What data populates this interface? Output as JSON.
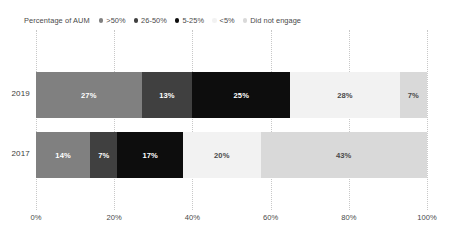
{
  "legend": {
    "title": "Percentage of AUM",
    "items": [
      {
        "label": ">50%",
        "color": "#808080"
      },
      {
        "label": "26-50%",
        "color": "#404040"
      },
      {
        "label": "5-25%",
        "color": "#0d0d0d"
      },
      {
        "label": "<5%",
        "color": "#f2f2f2"
      },
      {
        "label": "Did not engage",
        "color": "#d9d9d9"
      }
    ]
  },
  "chart_data": {
    "type": "bar",
    "orientation": "horizontal",
    "stacked": true,
    "normalized": true,
    "title": "",
    "subtitle": "",
    "xlabel": "",
    "ylabel": "",
    "xlim": [
      0,
      100
    ],
    "grid": true,
    "legend_position": "top-left",
    "legend_title": "Percentage of AUM",
    "categories": [
      "2019",
      "2017"
    ],
    "xticks": [
      0,
      20,
      40,
      60,
      80,
      100
    ],
    "xticklabels": [
      "0%",
      "20%",
      "40%",
      "60%",
      "80%",
      "100%"
    ],
    "series": [
      {
        "name": ">50%",
        "color": "#808080",
        "text_color": "#ffffff",
        "values": [
          27,
          14
        ],
        "labels": [
          "27%",
          "14%"
        ]
      },
      {
        "name": "26-50%",
        "color": "#404040",
        "text_color": "#ffffff",
        "values": [
          13,
          7
        ],
        "labels": [
          "13%",
          "7%"
        ]
      },
      {
        "name": "5-25%",
        "color": "#0d0d0d",
        "text_color": "#ffffff",
        "values": [
          25,
          17
        ],
        "labels": [
          "25%",
          "17%"
        ]
      },
      {
        "name": "<5%",
        "color": "#f2f2f2",
        "text_color": "#4a4a4a",
        "values": [
          28,
          20
        ],
        "labels": [
          "28%",
          "20%"
        ]
      },
      {
        "name": "Did not engage",
        "color": "#d9d9d9",
        "text_color": "#4a4a4a",
        "values": [
          7,
          43
        ],
        "labels": [
          "7%",
          "43%"
        ]
      }
    ]
  }
}
